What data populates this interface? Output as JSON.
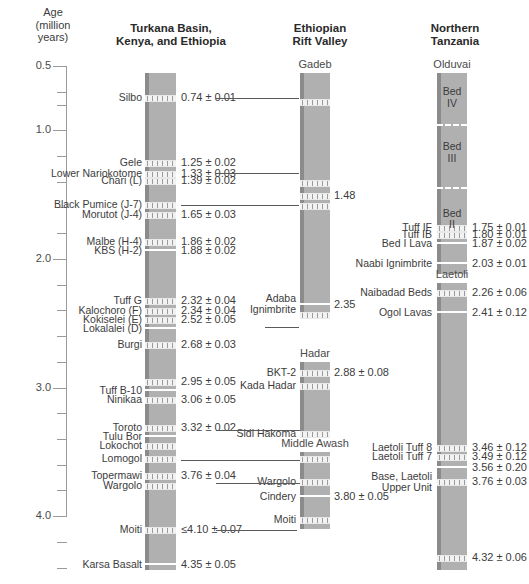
{
  "axis": {
    "title": "Age\n(million\nyears)",
    "ticks": [
      {
        "value": "0.5",
        "age": 0.5,
        "major": true
      },
      {
        "value": "",
        "age": 0.7,
        "major": false
      },
      {
        "value": "",
        "age": 0.8,
        "major": false
      },
      {
        "value": "1.0",
        "age": 1.0,
        "major": true
      },
      {
        "value": "",
        "age": 1.2,
        "major": false
      },
      {
        "value": "",
        "age": 1.4,
        "major": false
      },
      {
        "value": "",
        "age": 1.6,
        "major": false
      },
      {
        "value": "",
        "age": 1.8,
        "major": false
      },
      {
        "value": "2.0",
        "age": 2.0,
        "major": true
      },
      {
        "value": "",
        "age": 2.2,
        "major": false
      },
      {
        "value": "",
        "age": 2.4,
        "major": false
      },
      {
        "value": "",
        "age": 2.6,
        "major": false
      },
      {
        "value": "",
        "age": 2.8,
        "major": false
      },
      {
        "value": "3.0",
        "age": 3.0,
        "major": true
      },
      {
        "value": "",
        "age": 3.2,
        "major": false
      },
      {
        "value": "",
        "age": 3.4,
        "major": false
      },
      {
        "value": "",
        "age": 3.6,
        "major": false
      },
      {
        "value": "",
        "age": 3.8,
        "major": false
      },
      {
        "value": "4.0",
        "age": 4.0,
        "major": true
      },
      {
        "value": "",
        "age": 4.2,
        "major": false
      },
      {
        "value": "",
        "age": 4.4,
        "major": false
      }
    ],
    "min": 0.5,
    "max": 4.5,
    "unit": "million years"
  },
  "columns": [
    {
      "id": "turkana",
      "header": "Turkana Basin,\nKenya, and Ethiopia",
      "sections": [
        {
          "name": "",
          "top_age": 0.555,
          "bottom_age": 4.42
        }
      ]
    },
    {
      "id": "ethiopian",
      "header": "Ethiopian\nRift Valley",
      "sections": [
        {
          "name": "Gadeb",
          "top_age": 0.555,
          "bottom_age": 2.46
        },
        {
          "name": "Hadar",
          "top_age": 2.8,
          "bottom_age": 3.37
        },
        {
          "name": "Middle Awash",
          "top_age": 3.5,
          "bottom_age": 4.1
        }
      ]
    },
    {
      "id": "tanzania",
      "header": "Northern\nTanzania",
      "sections": [
        {
          "name": "Olduvai",
          "top_age": 0.555,
          "bottom_age": 2.12
        },
        {
          "name": "Laetoli",
          "top_age": 2.19,
          "bottom_age": 4.42
        }
      ]
    }
  ],
  "turkana_units": [
    {
      "label": "Silbo",
      "age_text": "0.74 ± 0.01",
      "age": 0.74,
      "band": true
    },
    {
      "label": "Gele",
      "age_text": "1.25 ± 0.02",
      "age": 1.25,
      "band": true
    },
    {
      "label": "Lower Nariokotome",
      "age_text": "1.33 ± 0.03",
      "age": 1.33,
      "band": true
    },
    {
      "label": "Chari (L)",
      "age_text": "1.39 ± 0.02",
      "age": 1.39,
      "band": true
    },
    {
      "label": "Black Pumice (J-7)",
      "age_text": "",
      "age": 1.57,
      "band": true
    },
    {
      "label": "Morutot (J-4)",
      "age_text": "1.65 ± 0.03",
      "age": 1.65,
      "band": true
    },
    {
      "label": "Malbe (H-4)",
      "age_text": "1.86 ± 0.02",
      "age": 1.86,
      "band": true
    },
    {
      "label": "KBS (H-2)",
      "age_text": "1.88 ± 0.02",
      "age": 1.93,
      "band": false
    },
    {
      "label": "Tuff G",
      "age_text": "2.32 ± 0.04",
      "age": 2.32,
      "band": true
    },
    {
      "label": "Kalochoro (F)",
      "age_text": "2.34 ± 0.04",
      "age": 2.4,
      "band": true
    },
    {
      "label": "Kokiselei (E)",
      "age_text": "2.52 ± 0.05",
      "age": 2.47,
      "band": true
    },
    {
      "label": "Lokalalei (D)",
      "age_text": "",
      "age": 2.54,
      "band": false
    },
    {
      "label": "Burgi",
      "age_text": "2.68 ± 0.03",
      "age": 2.66,
      "band": true
    },
    {
      "label": "",
      "age_text": "2.95 ± 0.05",
      "age": 2.95,
      "band": true
    },
    {
      "label": "Tuff B-10",
      "age_text": "",
      "age": 3.02,
      "band": false
    },
    {
      "label": "Ninikaa",
      "age_text": "3.06 ± 0.05",
      "age": 3.09,
      "band": true
    },
    {
      "label": "Toroto",
      "age_text": "3.32 ± 0.02",
      "age": 3.31,
      "band": true
    },
    {
      "label": "Tulu Bor",
      "age_text": "",
      "age": 3.38,
      "band": false
    },
    {
      "label": "Lokochot",
      "age_text": "",
      "age": 3.45,
      "band": true
    },
    {
      "label": "Lomogol",
      "age_text": "",
      "age": 3.55,
      "band": true
    },
    {
      "label": "Topermawi",
      "age_text": "3.76 ± 0.04",
      "age": 3.68,
      "band": true
    },
    {
      "label": "Wargolo",
      "age_text": "",
      "age": 3.76,
      "band": true
    },
    {
      "label": "Moiti",
      "age_text": "≤4.10 ± 0.07",
      "age": 4.1,
      "band": true
    },
    {
      "label": "Karsa Basalt",
      "age_text": "4.35 ± 0.05",
      "age": 4.37,
      "band": false
    }
  ],
  "ethiopian_units": [
    {
      "label": "",
      "age_text": "",
      "age": 0.77,
      "band": true
    },
    {
      "label": "",
      "age_text": "",
      "age": 1.4,
      "band": true
    },
    {
      "label": "",
      "age_text": "1.48",
      "age": 1.5,
      "band": true
    },
    {
      "label": "",
      "age_text": "",
      "age": 1.58,
      "band": true
    },
    {
      "label": "Adaba\nIgnimbrite",
      "age_text": "2.35",
      "age": 2.35,
      "band": false
    },
    {
      "label": "",
      "age_text": "",
      "age": 2.43,
      "band": true
    },
    {
      "label": "BKT-2",
      "age_text": "2.88 ± 0.08",
      "age": 2.88,
      "band": true
    },
    {
      "label": "Kada Hadar",
      "age_text": "",
      "age": 2.98,
      "band": true
    },
    {
      "label": "Sidi Hakoma",
      "age_text": "",
      "age": 3.35,
      "band": true
    },
    {
      "label": "",
      "age_text": "",
      "age": 3.55,
      "band": true
    },
    {
      "label": "Wargolo",
      "age_text": "",
      "age": 3.73,
      "band": true
    },
    {
      "label": "Cindery",
      "age_text": "3.80 ± 0.05",
      "age": 3.84,
      "band": false
    },
    {
      "label": "Moiti",
      "age_text": "",
      "age": 4.02,
      "band": true
    }
  ],
  "tanzania_units": [
    {
      "label": "Tuff IF",
      "age_text": "1.75 ± 0.01",
      "age": 1.75,
      "band": true
    },
    {
      "label": "Tuff IB",
      "age_text": "1.80 ± 0.01",
      "age": 1.81,
      "band": true
    },
    {
      "label": "Bed I Lava",
      "age_text": "1.87 ± 0.02",
      "age": 1.88,
      "band": false
    },
    {
      "label": "Naabi Ignimbrite",
      "age_text": "2.03 ± 0.01",
      "age": 2.03,
      "band": false
    },
    {
      "label": "Naibadad Beds",
      "age_text": "2.26 ± 0.06",
      "age": 2.26,
      "band": true
    },
    {
      "label": "Ogol Lavas",
      "age_text": "2.41 ± 0.12",
      "age": 2.41,
      "band": false
    },
    {
      "label": "Laetoli Tuff 8",
      "age_text": "3.46 ± 0.12",
      "age": 3.46,
      "band": true
    },
    {
      "label": "Laetoli Tuff 7",
      "age_text": "3.49 ± 0.12",
      "age": 3.53,
      "band": true
    },
    {
      "label": "",
      "age_text": "3.56 ± 0.20",
      "age": 3.62,
      "band": false
    },
    {
      "label": "Base, Laetoli\nUpper Unit",
      "age_text": "3.76 ± 0.03",
      "age": 3.73,
      "band": true
    },
    {
      "label": "",
      "age_text": "4.32 ± 0.06",
      "age": 4.32,
      "band": true
    }
  ],
  "olduvai_beds": [
    {
      "label": "Bed\nIV",
      "top_age": 0.57,
      "bottom_age": 0.93
    },
    {
      "label": "Bed\nIII",
      "top_age": 0.95,
      "bottom_age": 1.41
    },
    {
      "label": "Bed\nII",
      "top_age": 1.44,
      "bottom_age": 1.95
    }
  ],
  "connectors": [
    {
      "name": "silbo-gadeb",
      "y_age": 0.75,
      "x1": 216,
      "x2": 299
    },
    {
      "name": "chari-gadeb",
      "y_age": 1.33,
      "x1": 216,
      "x2": 299
    },
    {
      "name": "blackpumice-gadeb",
      "y_age": 1.58,
      "x1": 181,
      "x2": 299
    },
    {
      "name": "lokalalei-adaba",
      "y_age": 2.53,
      "x1": 265,
      "x2": 299
    },
    {
      "name": "toroto-sidi",
      "y_age": 3.33,
      "x1": 216,
      "x2": 300
    },
    {
      "name": "lomogol-awash",
      "y_age": 3.56,
      "x1": 181,
      "x2": 300
    },
    {
      "name": "wargolo-wargolo",
      "y_age": 3.74,
      "x1": 216,
      "x2": 300
    },
    {
      "name": "moiti-moiti",
      "y_age": 4.11,
      "x1": 216,
      "x2": 297
    }
  ]
}
